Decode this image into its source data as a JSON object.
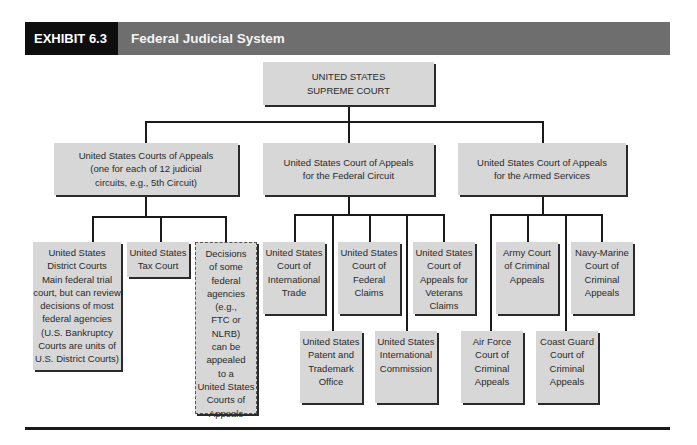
{
  "header": {
    "exhibit_label": "EXHIBIT 6.3",
    "title": "Federal Judicial System",
    "colors": {
      "exhibit_bg": "#0e0e0e",
      "title_bg": "#6e6e6e",
      "box_fill": "#d7d7d7"
    }
  },
  "chart": {
    "root": {
      "label": "UNITED STATES\nSUPREME COURT"
    },
    "level1": [
      {
        "label": "United States Courts of Appeals\n(one for each of 12 judicial\ncircuits, e.g., 5th Circuit)"
      },
      {
        "label": "United States Court of Appeals\nfor the Federal Circuit"
      },
      {
        "label": "United States Court of Appeals\nfor the Armed Services"
      }
    ],
    "circuit_children": [
      {
        "label": "United States\nDistrict Courts\nMain federal trial\ncourt, but can review\ndecisions of most\nfederal agencies\n(U.S. Bankruptcy\nCourts are units of\nU.S. District Courts)"
      },
      {
        "label": "United States\nTax Court"
      },
      {
        "label": "Decisions\nof some\nfederal\nagencies\n(e.g.,\nFTC or NLRB)\ncan be\nappealed\nto a\nUnited States\nCourts of\nAppeals",
        "style": "dashed"
      }
    ],
    "federal_children": [
      {
        "label": "United States\nCourt of\nInternational\nTrade"
      },
      {
        "label": "United States\nPatent and\nTrademark\nOffice"
      },
      {
        "label": "United States\nCourt of\nFederal\nClaims"
      },
      {
        "label": "United States\nInternational\nCommission"
      },
      {
        "label": "United States\nCourt of\nAppeals for\nVeterans\nClaims"
      }
    ],
    "armed_children": [
      {
        "label": "Air Force\nCourt of\nCriminal\nAppeals"
      },
      {
        "label": "Army Court\nof Criminal\nAppeals"
      },
      {
        "label": "Coast Guard\nCourt of\nCriminal\nAppeals"
      },
      {
        "label": "Navy-Marine\nCourt of\nCriminal\nAppeals"
      }
    ]
  }
}
